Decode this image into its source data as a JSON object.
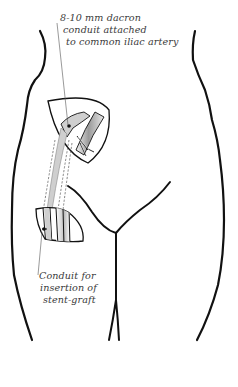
{
  "diagram": {
    "colors": {
      "outline": "#111111",
      "leader": "#555555",
      "conduit_fill": "#cfcfcf",
      "artery_fill": "#bdbdbd",
      "text": "#3a3a3a"
    },
    "labels": {
      "top": {
        "lines": [
          "8-10 mm dacron",
          "conduit attached",
          "to common iliac artery"
        ]
      },
      "bottom": {
        "lines": [
          "Conduit for",
          "insertion of",
          "stent-graft"
        ]
      }
    },
    "parts": [
      "body-outline-left",
      "body-outline-right",
      "groin-crease",
      "thigh-inner-lines",
      "upper-incision",
      "lower-incision",
      "dacron-conduit",
      "common-iliac-artery"
    ]
  }
}
